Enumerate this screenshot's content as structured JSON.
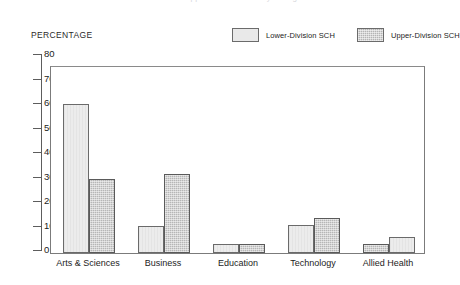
{
  "title_faint": "Lower- and Upper-Division SCH by College",
  "axis_title": "PERCENTAGE",
  "legend": {
    "entries": [
      {
        "label": "Lower-Division SCH",
        "swatch": "light-solid",
        "color": "#e9e9e9"
      },
      {
        "label": "Upper-Division SCH",
        "swatch": "dark-hatched",
        "color": "#b4b4b4"
      }
    ]
  },
  "y_axis": {
    "ticks": [
      "0",
      "10",
      "20",
      "30",
      "40",
      "50",
      "60",
      "70",
      "80"
    ],
    "min": 0,
    "max": 80
  },
  "x_axis": {
    "categories": [
      "Arts & Sciences",
      "Business",
      "Education",
      "Technology",
      "Allied Health"
    ]
  },
  "chart_data": {
    "type": "bar",
    "title": "Lower- and Upper-Division SCH by College",
    "xlabel": "",
    "ylabel": "PERCENTAGE",
    "ylim": [
      0,
      80
    ],
    "ytick_step": 10,
    "grid": false,
    "legend_position": "top-right",
    "categories": [
      "Arts & Sciences",
      "Business",
      "Education",
      "Technology",
      "Allied Health"
    ],
    "series": [
      {
        "name": "Lower-Division SCH",
        "color": "#e9e9e9",
        "values": [
          64,
          11.5,
          4,
          12,
          7
        ]
      },
      {
        "name": "Upper-Division SCH",
        "color": "#b4b4b4",
        "values": [
          32,
          34,
          4,
          15,
          4
        ]
      }
    ]
  },
  "bars": [
    {
      "group": "Arts & Sciences",
      "series": "Lower-Division SCH",
      "value": 64,
      "style": "bar-lower",
      "left": 12,
      "width": 26
    },
    {
      "group": "Arts & Sciences",
      "series": "Upper-Division SCH",
      "value": 32,
      "style": "bar-upper",
      "left": 38,
      "width": 26
    },
    {
      "group": "Business",
      "series": "Lower-Division SCH",
      "value": 11.5,
      "style": "bar-lower",
      "left": 87,
      "width": 26
    },
    {
      "group": "Business",
      "series": "Upper-Division SCH",
      "value": 34,
      "style": "bar-upper",
      "left": 113,
      "width": 26
    },
    {
      "group": "Education",
      "series": "Lower-Division SCH",
      "value": 4,
      "style": "bar-lower",
      "left": 162,
      "width": 26
    },
    {
      "group": "Education",
      "series": "Upper-Division SCH",
      "value": 4,
      "style": "bar-upper",
      "left": 188,
      "width": 26
    },
    {
      "group": "Technology",
      "series": "Lower-Division SCH",
      "value": 12,
      "style": "bar-lower",
      "left": 237,
      "width": 26
    },
    {
      "group": "Technology",
      "series": "Upper-Division SCH",
      "value": 15,
      "style": "bar-upper",
      "left": 263,
      "width": 26
    },
    {
      "group": "Allied Health",
      "series": "Upper-Division SCH",
      "value": 4,
      "style": "bar-upper",
      "left": 312,
      "width": 26
    },
    {
      "group": "Allied Health",
      "series": "Lower-Division SCH",
      "value": 7,
      "style": "bar-lower",
      "left": 338,
      "width": 26
    }
  ],
  "group_label_centers": [
    38,
    113,
    188,
    263,
    338
  ]
}
